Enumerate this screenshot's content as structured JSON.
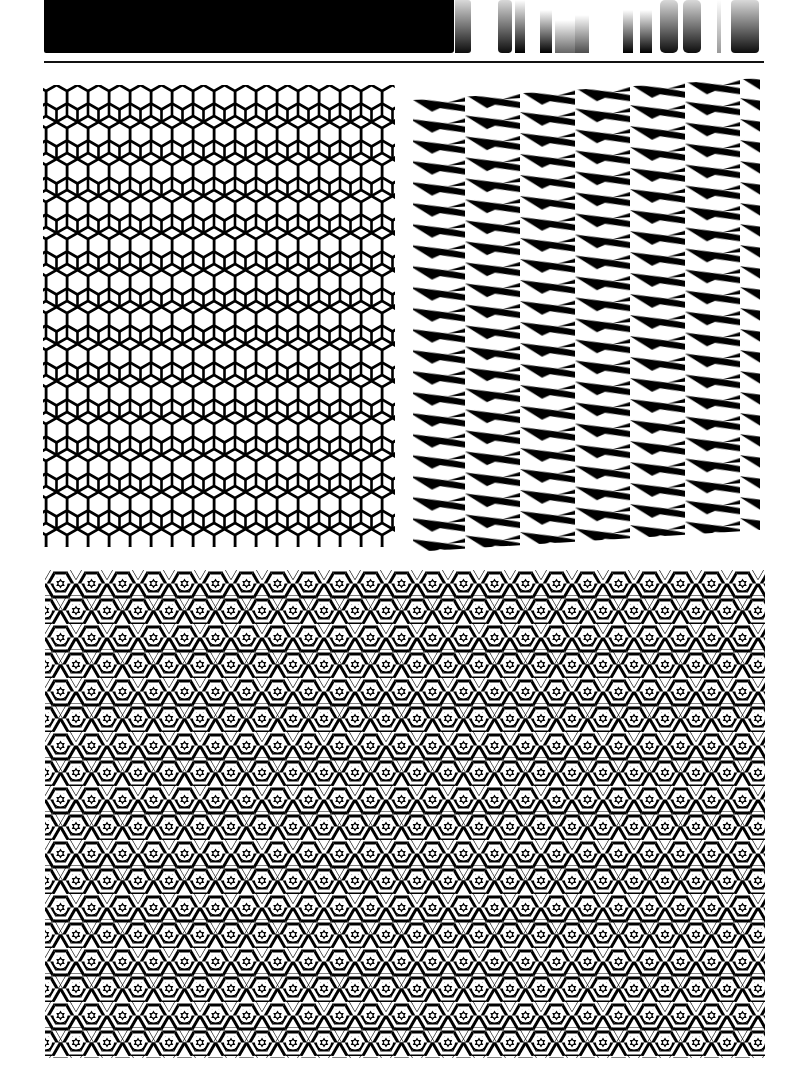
{
  "page": {
    "type": "pattern-sheet",
    "background": "#ffffff",
    "ink": "#000000"
  },
  "header": {
    "bar_color": "#000000",
    "title_text": "",
    "title_legible": false
  },
  "panels": [
    {
      "id": "hexagon-grid",
      "pattern": "hexagon-outline-grid",
      "cell_width_px": 21,
      "row_pitch_px": 18.5
    },
    {
      "id": "zigzag-wedges",
      "pattern": "slanted-wedge-stripes",
      "column_width_px": 55,
      "row_pitch_px": 21
    },
    {
      "id": "striped-hex-stars",
      "pattern": "striped-triangles-with-stars",
      "cell_pitch_x_px": 31,
      "cell_pitch_y_px": 27
    }
  ]
}
